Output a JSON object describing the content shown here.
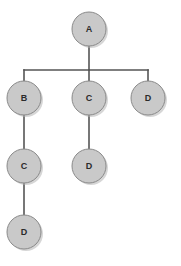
{
  "diagram": {
    "type": "tree",
    "background_color": "#ffffff",
    "node_fill_color": "#c9c9c9",
    "node_stroke_color": "#8a8a8a",
    "edge_color": "#555555",
    "label_color": "#2b2b2b",
    "node_radius": 17,
    "nodes": [
      {
        "id": "n0",
        "label": "A",
        "cx": 89,
        "cy": 29,
        "level": 0
      },
      {
        "id": "n1",
        "label": "B",
        "cx": 24,
        "cy": 98,
        "level": 1
      },
      {
        "id": "n2",
        "label": "C",
        "cx": 89,
        "cy": 98,
        "level": 1
      },
      {
        "id": "n3",
        "label": "D",
        "cx": 148,
        "cy": 98,
        "level": 1
      },
      {
        "id": "n4",
        "label": "C",
        "cx": 24,
        "cy": 166,
        "level": 2
      },
      {
        "id": "n5",
        "label": "D",
        "cx": 89,
        "cy": 166,
        "level": 2
      },
      {
        "id": "n6",
        "label": "D",
        "cx": 24,
        "cy": 232,
        "level": 3
      }
    ],
    "edges": [
      {
        "from": "n0",
        "to": "n1",
        "style": "orthogonal"
      },
      {
        "from": "n0",
        "to": "n2",
        "style": "straight"
      },
      {
        "from": "n0",
        "to": "n3",
        "style": "orthogonal"
      },
      {
        "from": "n1",
        "to": "n4",
        "style": "straight"
      },
      {
        "from": "n2",
        "to": "n5",
        "style": "straight"
      },
      {
        "from": "n4",
        "to": "n6",
        "style": "straight"
      }
    ],
    "connector_bar": {
      "y": 70,
      "x_start": 24,
      "x_end": 148
    }
  }
}
